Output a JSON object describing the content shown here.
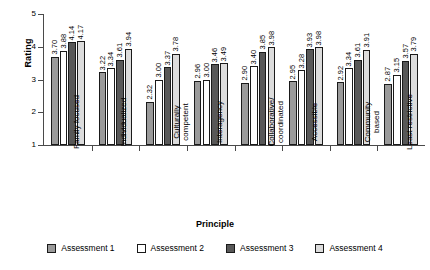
{
  "chart_data": {
    "type": "bar",
    "title": "",
    "xlabel": "Principle",
    "ylabel": "Rating",
    "ylim": [
      1,
      5
    ],
    "yticks": [
      "1",
      "2",
      "3",
      "4",
      "5"
    ],
    "grid": false,
    "legend_position": "bottom",
    "orientation": "vertical-grouped",
    "categories": [
      "Family focused",
      "Individualized",
      "Culturally competent",
      "Interagency",
      "Collaborative/ coordinated",
      "Accessible",
      "Community based",
      "Least restrictive"
    ],
    "category_lines": [
      [
        "Family focused"
      ],
      [
        "Individualized"
      ],
      [
        "Culturally",
        "competent"
      ],
      [
        "Interagency"
      ],
      [
        "Collaborative/",
        "coordinated"
      ],
      [
        "Accessible"
      ],
      [
        "Community",
        "based"
      ],
      [
        "Least restrictive"
      ]
    ],
    "series": [
      {
        "name": "Assessment 1",
        "color": "#9a9a9a",
        "values": [
          3.7,
          3.22,
          2.32,
          2.96,
          2.9,
          2.95,
          2.92,
          2.87
        ],
        "labels": [
          "3.70",
          "3.22",
          "2.32",
          "2.96",
          "2.90",
          "2.95",
          "2.92",
          "2.87"
        ]
      },
      {
        "name": "Assessment 2",
        "color": "#ffffff",
        "values": [
          3.88,
          3.34,
          3.0,
          3.0,
          3.4,
          3.28,
          3.34,
          3.15
        ],
        "labels": [
          "3.88",
          "3.34",
          "3.00",
          "3.00",
          "3.40",
          "3.28",
          "3.34",
          "3.15"
        ]
      },
      {
        "name": "Assessment 3",
        "color": "#585858",
        "values": [
          4.14,
          3.61,
          3.37,
          3.46,
          3.85,
          3.93,
          3.61,
          3.57
        ],
        "labels": [
          "4.14",
          "3.61",
          "3.37",
          "3.46",
          "3.85",
          "3.93",
          "3.61",
          "3.57"
        ]
      },
      {
        "name": "Assessment 4",
        "color": "#dcdcdc",
        "values": [
          4.17,
          3.94,
          3.78,
          3.49,
          3.98,
          3.98,
          3.91,
          3.79
        ],
        "labels": [
          "4.17",
          "3.94",
          "3.78",
          "3.49",
          "3.98",
          "3.98",
          "3.91",
          "3.79"
        ]
      }
    ]
  }
}
